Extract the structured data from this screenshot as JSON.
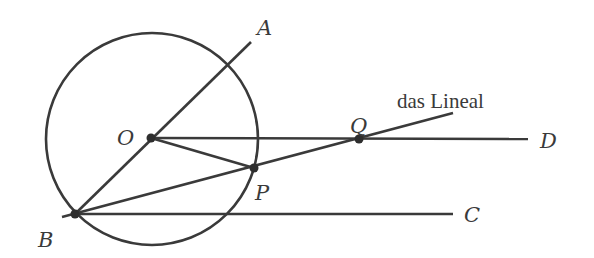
{
  "diagram": {
    "colors": {
      "background": "#ffffff",
      "ink": "#3a3a3a"
    },
    "circle": {
      "center_label": "O",
      "cx": 152,
      "cy": 139,
      "r": 106
    },
    "points": {
      "O": {
        "label": "O",
        "x": 151,
        "y": 138
      },
      "B": {
        "label": "B",
        "x": 75,
        "y": 214
      },
      "P": {
        "label": "P",
        "x": 254,
        "y": 168
      },
      "Q": {
        "label": "Q",
        "x": 359,
        "y": 139
      }
    },
    "ray_ends": {
      "A": {
        "label": "A",
        "x": 251,
        "y": 42
      },
      "C": {
        "label": "C",
        "x": 453,
        "y": 214
      },
      "D": {
        "label": "D",
        "x": 528,
        "y": 139
      }
    },
    "ruler": {
      "label": "das Lineal",
      "start": {
        "x": 62,
        "y": 217
      },
      "end": {
        "x": 453,
        "y": 113
      }
    },
    "segments": [
      {
        "name": "BA",
        "from": "B",
        "to": "A"
      },
      {
        "name": "BC",
        "from": "B",
        "to": "C"
      },
      {
        "name": "OD",
        "from": "O",
        "to": "D"
      },
      {
        "name": "OP",
        "from": "O",
        "to": "P"
      },
      {
        "name": "ruler",
        "from": "B",
        "to": "ruler-end",
        "through": [
          "P",
          "Q"
        ]
      }
    ]
  }
}
